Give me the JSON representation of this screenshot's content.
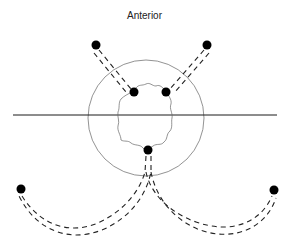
{
  "diagram": {
    "label": "Anterior",
    "colors": {
      "line": "#1a1a1a",
      "circle": "#777777",
      "tumor_outline": "#666666",
      "dot": "#000000"
    },
    "elements": {
      "reference_line": "horizontal line",
      "outer_circle": "circle",
      "tumor_outline": "irregular outline",
      "dots": [
        "top-left external",
        "top-right external",
        "inner left",
        "inner right",
        "inner bottom",
        "bottom-left external",
        "bottom-right external"
      ],
      "paths": [
        "top-left double dashed path",
        "top-right double dashed path",
        "bottom-left curved double dashed path",
        "bottom-right curved double dashed path"
      ]
    }
  }
}
